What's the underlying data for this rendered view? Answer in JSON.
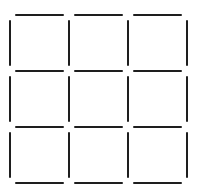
{
  "diagram": {
    "type": "matchstick-grid",
    "rows": 3,
    "cols": 3,
    "stroke_color": "#1e1e1e",
    "background": "#ffffff",
    "stroke_width": 2,
    "gap": 5,
    "x_lines": [
      10,
      69,
      128,
      187
    ],
    "y_lines": [
      15,
      71,
      127,
      183
    ],
    "horizontal_segments": 12,
    "vertical_segments": 12,
    "total_segments": 24
  }
}
